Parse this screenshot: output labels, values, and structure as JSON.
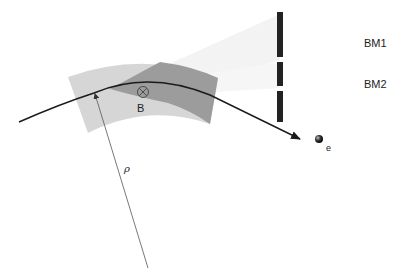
{
  "diagram": {
    "type": "synchrotron-radiation-bending-magnet",
    "labels": {
      "bm1": "BM1",
      "bm2": "BM2",
      "field": "B",
      "electron": "e",
      "radius": "ρ"
    },
    "icons": {
      "field_symbol": "circle-cross-icon (field into page ⊗)",
      "electron": "filled-sphere-icon"
    },
    "colors": {
      "magnet": "#d6d6d6",
      "overlap_wedge": "#9a9a9a",
      "radiation_fan": "#f2f2f2",
      "trajectory": "#1a1a1a",
      "screen": "#222222",
      "radius_line": "#555555"
    }
  }
}
